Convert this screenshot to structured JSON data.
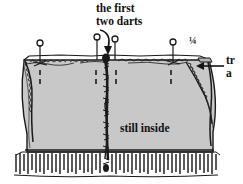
{
  "figure": {
    "kind": "sewing-diagram",
    "colors": {
      "background": "#ffffff",
      "fabric": "#c8c8c8",
      "fabric_shadow": "#b9b9b9",
      "ink": "#141414"
    },
    "annotations": {
      "first_two_darts": {
        "line1": "the first",
        "line2": "two darts"
      },
      "quarter_mark": "¼",
      "still_inside": "still inside",
      "trim_away_cut": {
        "line1": "tr",
        "line2": "a"
      }
    },
    "elements": {
      "pin_count": 4,
      "dart_count": 2,
      "arrow_down_label": "arrow pointing to darts",
      "arrow_left_label": "arrow pointing to trimmed seam"
    }
  }
}
